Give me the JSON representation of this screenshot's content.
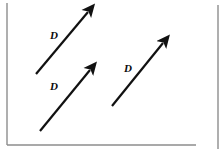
{
  "figure": {
    "background_color": "#ffffff",
    "ink_color": "#111111",
    "frame": {
      "border_color": "#8d8d8d",
      "left_rule": {
        "x": 7,
        "y1": 3,
        "y2": 145
      },
      "bottom_rule": {
        "y": 145,
        "x1": 7,
        "x2": 196
      },
      "right_rule": {
        "x": 218,
        "y1": 5,
        "y2": 149
      }
    },
    "arrows": [
      {
        "name": "vector-d-upper-left",
        "label": "D",
        "tail": {
          "x": 36,
          "y": 74
        },
        "tip": {
          "x": 88,
          "y": 12
        },
        "label_pos": {
          "x": 50,
          "y": 39
        },
        "stroke_width": 2.2
      },
      {
        "name": "vector-d-lower-left",
        "label": "D",
        "tail": {
          "x": 40,
          "y": 131
        },
        "tip": {
          "x": 90,
          "y": 70
        },
        "label_pos": {
          "x": 50,
          "y": 90
        },
        "stroke_width": 2.2
      },
      {
        "name": "vector-d-right",
        "label": "D",
        "tail": {
          "x": 112,
          "y": 106
        },
        "tip": {
          "x": 163,
          "y": 43
        },
        "label_pos": {
          "x": 124,
          "y": 72
        },
        "stroke_width": 2.2
      }
    ]
  }
}
